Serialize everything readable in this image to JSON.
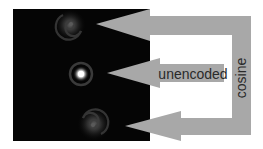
{
  "figure": {
    "width": 263,
    "height": 149,
    "background": "#ffffff",
    "panel": {
      "x": 13,
      "y": 9,
      "width": 137,
      "height": 132,
      "color": "#050505"
    },
    "arrow_color": "#a8a8a8",
    "text_color": "#2a2a2a"
  },
  "spots": [
    {
      "name": "top-psf",
      "cx": 70,
      "cy": 25,
      "type": "spiral",
      "intensity": 0.35
    },
    {
      "name": "center-psf",
      "cx": 81,
      "cy": 74,
      "type": "airy",
      "intensity": 1.0
    },
    {
      "name": "bottom-psf",
      "cx": 94,
      "cy": 124,
      "type": "spiral",
      "intensity": 0.35
    }
  ],
  "labels": {
    "unencoded": "unencoded",
    "cosine": "cosine"
  }
}
